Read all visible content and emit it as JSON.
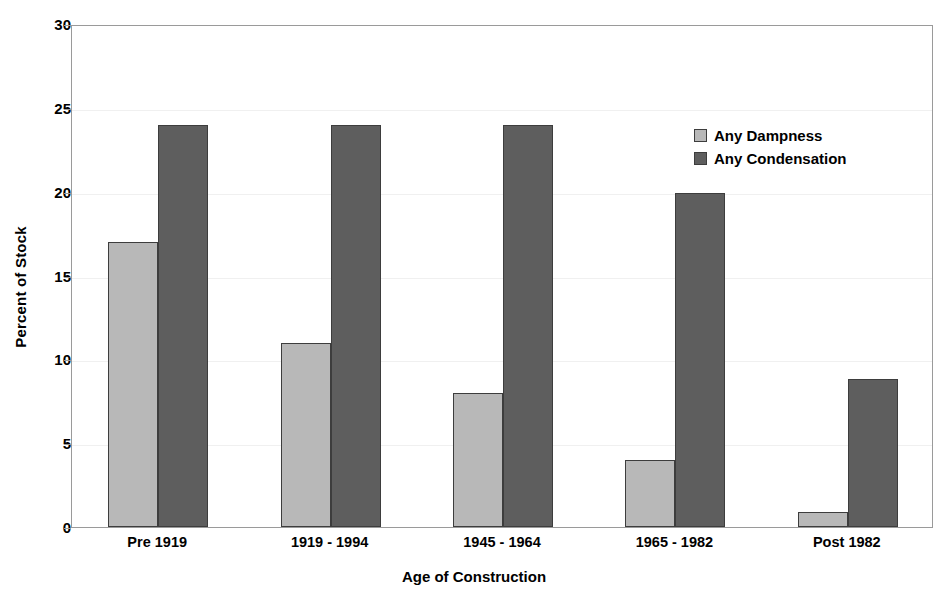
{
  "chart_data": {
    "type": "bar",
    "title": "",
    "xlabel": "Age of Construction",
    "ylabel": "Percent of Stock",
    "categories": [
      "Pre 1919",
      "1919 - 1994",
      "1945 - 1964",
      "1965 - 1982",
      "Post 1982"
    ],
    "series": [
      {
        "name": "Any Dampness",
        "color": "#b8b8b8",
        "values": [
          17,
          11,
          8,
          4,
          0.9
        ]
      },
      {
        "name": "Any Condensation",
        "color": "#5e5e5e",
        "values": [
          24,
          24,
          24,
          19.9,
          8.8
        ]
      }
    ],
    "ylim": [
      0,
      30
    ],
    "yticks": [
      0,
      5,
      10,
      15,
      20,
      25,
      30
    ],
    "ytick_labels": [
      "0",
      "5",
      "10",
      "15",
      "20",
      "25",
      "30"
    ],
    "grid": true,
    "grid_color": "#f0f0f0",
    "legend_position": "upper right",
    "bar_edge_color": "#3d3d3d",
    "axis_color": "#9a9a9a",
    "background": "#ffffff"
  }
}
